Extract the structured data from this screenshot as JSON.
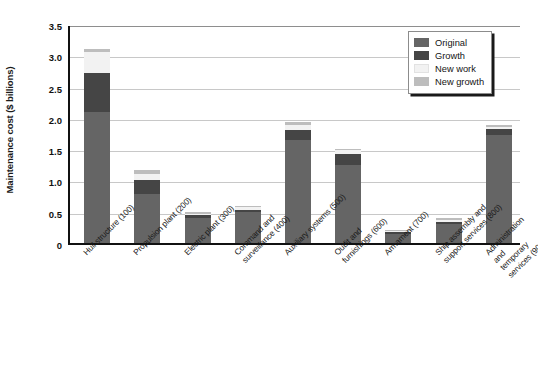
{
  "chart_data": {
    "type": "bar",
    "subtype": "stacked-bar",
    "title": "",
    "xlabel": "",
    "ylabel": "Maintenance cost ($ billions)",
    "ylim": [
      0,
      3.5
    ],
    "ytick_labels": [
      "3.5",
      "3.0",
      "2.5",
      "2.0",
      "1.5",
      "1.0",
      "0.5",
      "0"
    ],
    "ytick_values": [
      3.5,
      3.0,
      2.5,
      2.0,
      1.5,
      1.0,
      0.5,
      0
    ],
    "grid": "horizontal",
    "legend_position": "top-right",
    "categories": [
      "Hull structure (100)",
      "Propulsion plant (200)",
      "Electric plant (300)",
      "Command and\nsurveillance (400)",
      "Auxiliary systems (500)",
      "Outfit and\nfurnishings (600)",
      "Armament (700)",
      "Ship assembly and\nsupport services (800)",
      "Administration and\ntemporary services (900)"
    ],
    "series": [
      {
        "name": "Original",
        "color": "#656565",
        "values": [
          2.1,
          0.78,
          0.4,
          0.5,
          1.65,
          1.25,
          0.14,
          0.3,
          1.72
        ]
      },
      {
        "name": "Growth",
        "color": "#454545",
        "values": [
          0.62,
          0.22,
          0.05,
          0.03,
          0.16,
          0.17,
          0.03,
          0.04,
          0.1
        ]
      },
      {
        "name": "New work",
        "color": "#f2f2f2",
        "values": [
          0.33,
          0.11,
          0.02,
          0.04,
          0.08,
          0.06,
          0.02,
          0.03,
          0.03
        ]
      },
      {
        "name": "New growth",
        "color": "#bdbdbd",
        "values": [
          0.05,
          0.05,
          0.02,
          0.02,
          0.04,
          0.03,
          0.02,
          0.03,
          0.03
        ]
      }
    ],
    "totals": [
      3.1,
      1.16,
      0.49,
      0.59,
      1.93,
      1.51,
      0.21,
      0.4,
      1.88
    ]
  },
  "legend": {
    "items": [
      {
        "label": "Original"
      },
      {
        "label": "Growth"
      },
      {
        "label": "New work"
      },
      {
        "label": "New growth"
      }
    ]
  }
}
